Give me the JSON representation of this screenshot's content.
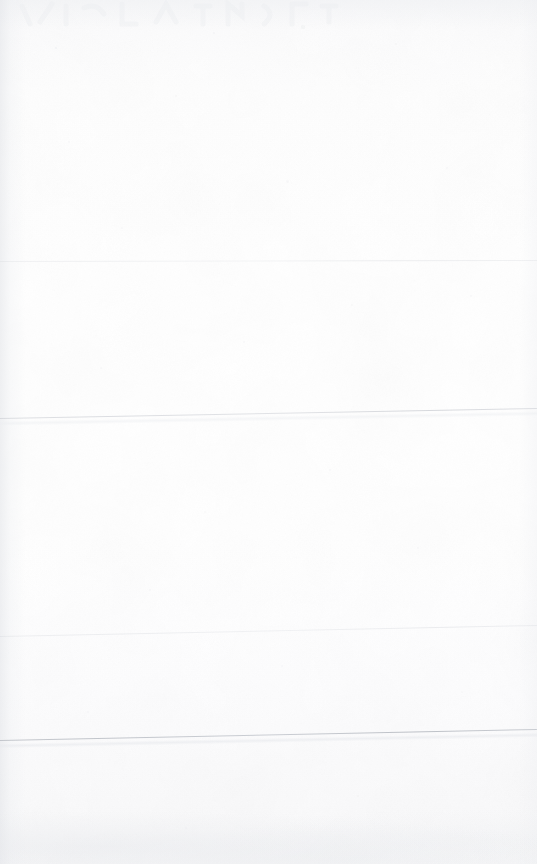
{
  "document": {
    "kind": "scanned-page",
    "title": "Scanned blank page",
    "page_width": 537,
    "page_height": 864,
    "orientation": "portrait",
    "text_content": "",
    "visible_text_present": false,
    "paper_color": "#fdfdfe",
    "background_color": "#ffffff",
    "ink_color": "#c4c7cd",
    "strongest_ink_color": "#b0b4bb",
    "notes_label": "",
    "skew_degrees": -0.107
  },
  "ruled_lines": [
    {
      "index": 1,
      "name": "rule-line-1",
      "left_x": 0,
      "left_y": 261,
      "right_x": 537,
      "right_y": 260,
      "thickness_px": 1,
      "opacity": 0.5,
      "color": "#ccd0d6",
      "strength": "faintest"
    },
    {
      "index": 2,
      "name": "rule-line-2",
      "left_x": 0,
      "left_y": 418,
      "right_x": 537,
      "right_y": 408,
      "thickness_px": 1,
      "opacity": 0.75,
      "color": "#c4c7ce",
      "strength": "medium"
    },
    {
      "index": 3,
      "name": "rule-line-3",
      "left_x": 0,
      "left_y": 636,
      "right_x": 537,
      "right_y": 625,
      "thickness_px": 1,
      "opacity": 0.55,
      "color": "#ced2d8",
      "strength": "faint"
    },
    {
      "index": 4,
      "name": "rule-line-4",
      "left_x": 0,
      "left_y": 740,
      "right_x": 537,
      "right_y": 729,
      "thickness_px": 1.2,
      "opacity": 0.9,
      "color": "#b8bcc3",
      "strength": "strongest"
    }
  ],
  "artifacts": {
    "left_edge_shadow": true,
    "right_edge_falloff": true,
    "top_edge_falloff": true,
    "bottom_smudge_band": true,
    "bleed_through_ghost_top": true,
    "paper_grain": true,
    "speck_count": 22
  },
  "specks": [
    {
      "x": 56,
      "y": 48,
      "r": 1.4,
      "o": 0.35
    },
    {
      "x": 214,
      "y": 33,
      "r": 1.1,
      "o": 0.3
    },
    {
      "x": 303,
      "y": 27,
      "r": 1.6,
      "o": 0.28
    },
    {
      "x": 396,
      "y": 44,
      "r": 1.2,
      "o": 0.26
    },
    {
      "x": 176,
      "y": 96,
      "r": 1.3,
      "o": 0.24
    },
    {
      "x": 69,
      "y": 142,
      "r": 1.0,
      "o": 0.22
    },
    {
      "x": 287,
      "y": 181,
      "r": 1.5,
      "o": 0.25
    },
    {
      "x": 447,
      "y": 168,
      "r": 1.1,
      "o": 0.2
    },
    {
      "x": 122,
      "y": 228,
      "r": 1.2,
      "o": 0.22
    },
    {
      "x": 352,
      "y": 305,
      "r": 1.4,
      "o": 0.24
    },
    {
      "x": 244,
      "y": 342,
      "r": 1.0,
      "o": 0.2
    },
    {
      "x": 471,
      "y": 296,
      "r": 1.3,
      "o": 0.22
    },
    {
      "x": 101,
      "y": 368,
      "r": 1.1,
      "o": 0.2
    },
    {
      "x": 330,
      "y": 470,
      "r": 1.2,
      "o": 0.22
    },
    {
      "x": 205,
      "y": 512,
      "r": 1.0,
      "o": 0.18
    },
    {
      "x": 418,
      "y": 548,
      "r": 1.4,
      "o": 0.22
    },
    {
      "x": 150,
      "y": 590,
      "r": 1.1,
      "o": 0.2
    },
    {
      "x": 282,
      "y": 666,
      "r": 1.3,
      "o": 0.22
    },
    {
      "x": 462,
      "y": 692,
      "r": 1.0,
      "o": 0.18
    },
    {
      "x": 88,
      "y": 712,
      "r": 1.2,
      "o": 0.2
    },
    {
      "x": 358,
      "y": 796,
      "r": 1.4,
      "o": 0.24
    },
    {
      "x": 186,
      "y": 828,
      "r": 1.1,
      "o": 0.2
    }
  ]
}
